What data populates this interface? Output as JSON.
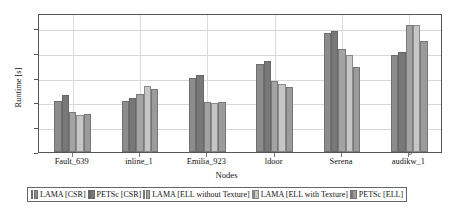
{
  "chart_data": {
    "type": "bar",
    "title": "",
    "subtitle": "",
    "xlabel": "Nodes",
    "ylabel": "Runtime [s]",
    "ylim": [
      0,
      11.2
    ],
    "yticks": [
      0,
      2,
      4,
      6,
      8,
      10
    ],
    "ytick_labels": [
      "0",
      "2",
      "4",
      "6",
      "8",
      "10"
    ],
    "grid": true,
    "grid_axis": "y",
    "legend_position": "bottom",
    "categories": [
      "Fault_639",
      "inline_1",
      "Emilia_923",
      "ldoor",
      "Serena",
      "audikw_1"
    ],
    "series": [
      {
        "name": "LAMA [CSR]",
        "color": "#8c8c8c",
        "values": [
          4.15,
          4.1,
          6.0,
          7.1,
          9.55,
          7.8
        ]
      },
      {
        "name": "PETSc [CSR]",
        "color": "#787878",
        "values": [
          4.6,
          4.35,
          6.2,
          7.35,
          9.75,
          8.05
        ]
      },
      {
        "name": "LAMA [ELL without Texture]",
        "color": "#a3a3a3",
        "values": [
          3.25,
          4.65,
          4.0,
          5.75,
          8.3,
          10.25
        ]
      },
      {
        "name": "LAMA [ELL with Texture]",
        "color": "#c6c6c6",
        "values": [
          3.0,
          5.3,
          3.95,
          5.5,
          7.85,
          10.25
        ]
      },
      {
        "name": "PETSc [ELL]",
        "color": "#9b9b9b",
        "values": [
          3.1,
          5.1,
          4.05,
          5.2,
          6.85,
          8.95
        ]
      }
    ]
  },
  "axes": {
    "frame_color": "#555555",
    "gridline_color": "#d8d8d8"
  }
}
